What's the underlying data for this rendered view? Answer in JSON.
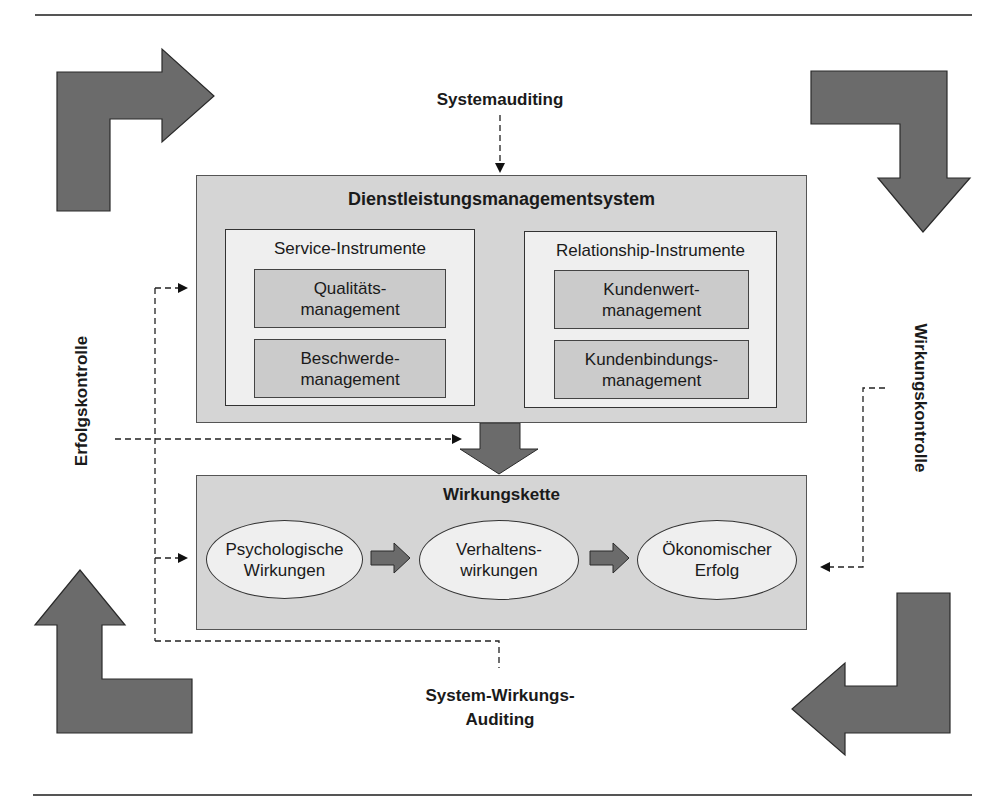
{
  "colors": {
    "outer_box": "#d5d5d5",
    "group_box": "#efefef",
    "inner_box": "#cbcbcb",
    "big_arrow": "#6b6b6b",
    "line": "#333333"
  },
  "labels": {
    "top": "Systemauditing",
    "left": "Erfolgskontrolle",
    "right": "Wirkungskontrolle",
    "bottom_line1": "System-Wirkungs-",
    "bottom_line2": "Auditing"
  },
  "system": {
    "title": "Dienstleistungsmanagementsystem",
    "groups": [
      {
        "title": "Service-Instrumente",
        "items": [
          {
            "line1": "Qualitäts-",
            "line2": "management"
          },
          {
            "line1": "Beschwerde-",
            "line2": "management"
          }
        ]
      },
      {
        "title": "Relationship-Instrumente",
        "items": [
          {
            "line1": "Kundenwert-",
            "line2": "management"
          },
          {
            "line1": "Kundenbindungs-",
            "line2": "management"
          }
        ]
      }
    ]
  },
  "chain": {
    "title": "Wirkungskette",
    "steps": [
      {
        "line1": "Psychologische",
        "line2": "Wirkungen"
      },
      {
        "line1": "Verhaltens-",
        "line2": "wirkungen"
      },
      {
        "line1": "Ökonomischer",
        "line2": "Erfolg"
      }
    ]
  },
  "icons": {
    "corner_arrows": [
      "arrow-right-corner-icon",
      "arrow-down-corner-icon",
      "arrow-left-corner-icon",
      "arrow-up-corner-icon"
    ],
    "center_arrow": "arrow-down-icon",
    "chain_arrows": "arrow-right-icon"
  }
}
